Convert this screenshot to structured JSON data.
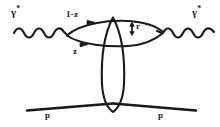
{
  "figure": {
    "kind": "feynman-diagram",
    "background_color": "#ffffff",
    "ink_color": "#1a1a1a",
    "labels": {
      "gamma_left": "γ",
      "gamma_left_star": "*",
      "gamma_right": "γ",
      "gamma_right_star": "*",
      "momentum_fraction_top": "1-z",
      "momentum_fraction_bottom": "z",
      "transverse_size": "r",
      "proton_in": "p",
      "proton_out": "p"
    },
    "elements": {
      "photon_left": "wavy-photon-line",
      "photon_right": "wavy-photon-line",
      "quark_loop": "quark-antiquark-dipole-lens",
      "gluon_exchange": "vertical-pomeron-ellipse",
      "proton_line": "proton-trajectory",
      "size_arrow": "double-headed-vertical-arrow",
      "quark_arrow_top": "left-pointing-arrowhead",
      "quark_arrow_bottom": "left-pointing-arrowhead"
    }
  }
}
